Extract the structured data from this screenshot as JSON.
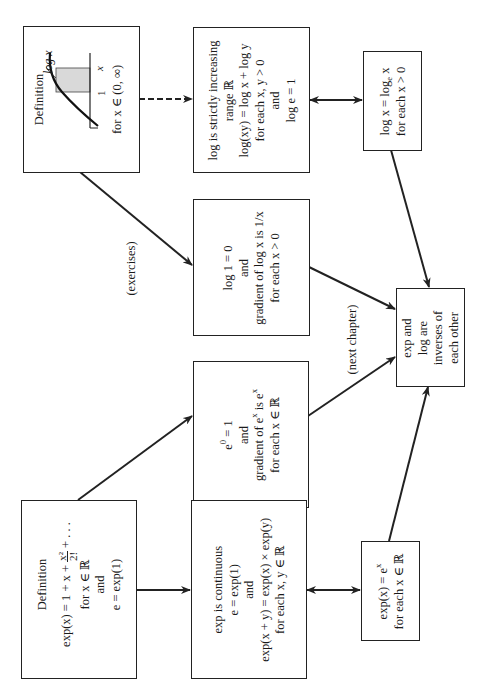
{
  "diagram": {
    "orientation": "rotated-90-ccw",
    "boxes": {
      "log_definition": {
        "title": "Definition",
        "graph_label": "log x",
        "axis_tick_1": "1",
        "axis_tick_x": "x",
        "domain": "for x ∈ (0, ∞)"
      },
      "log_properties": {
        "lines": [
          "log is strictly increasing",
          "range ℝ",
          "log(xy) = log x + log y",
          "for each x, y > 0",
          "and",
          "log e = 1"
        ]
      },
      "log_base_e": {
        "lines": [
          "log x = log",
          "for each x > 0"
        ],
        "subscript": "e",
        "after_subscript": " x"
      },
      "log_one_gradient": {
        "lines": [
          "log 1 = 0",
          "and",
          "gradient of log x is 1/x",
          "for each x > 0"
        ]
      },
      "exp_zero_gradient": {
        "line1_base": "e",
        "line1_sup": "0",
        "line1_rest": " = 1",
        "line2": "and",
        "line3_pre": "gradient of e",
        "line3_sup": "x",
        "line3_post": " is e",
        "line3_sup2": "x",
        "line4": "for each x ∈ ℝ"
      },
      "exp_definition": {
        "title": "Definition",
        "formula_pre": "exp(x) = 1 + x + ",
        "frac_num": "x²",
        "frac_den": "2!",
        "formula_post": " + . . .",
        "line3": "for x ∈ ℝ",
        "line4": "and",
        "line5": "e = exp(1)"
      },
      "exp_continuous": {
        "lines": [
          "exp is continuous",
          "e = exp(1)",
          "and",
          "exp(x + y) = exp(x) × exp(y)",
          "for each x, y ∈ ℝ"
        ]
      },
      "exp_power": {
        "line1_pre": "exp(x) = e",
        "line1_sup": "x",
        "line2": "for each x ∈ ℝ"
      },
      "inverses": {
        "lines": [
          "exp and",
          "log are",
          "inverses of",
          "each other"
        ]
      }
    },
    "edge_labels": {
      "exercises": "(exercises)",
      "next_chapter": "(next chapter)"
    },
    "edges": [
      {
        "from": "log_definition",
        "to": "log_properties",
        "style": "dashed",
        "arrow": "end"
      },
      {
        "from": "log_properties",
        "to": "log_base_e",
        "style": "solid",
        "arrow": "both"
      },
      {
        "from": "log_definition",
        "to": "log_one_gradient",
        "style": "solid",
        "arrow": "end",
        "label": "(exercises)"
      },
      {
        "from": "log_one_gradient",
        "to": "inverses",
        "style": "solid",
        "arrow": "end"
      },
      {
        "from": "exp_zero_gradient",
        "to": "inverses",
        "style": "solid",
        "arrow": "end",
        "label": "(next chapter)"
      },
      {
        "from": "log_base_e",
        "to": "inverses",
        "style": "solid",
        "arrow": "end"
      },
      {
        "from": "exp_power",
        "to": "inverses",
        "style": "solid",
        "arrow": "end"
      },
      {
        "from": "exp_definition",
        "to": "exp_zero_gradient",
        "style": "solid",
        "arrow": "end"
      },
      {
        "from": "exp_definition",
        "to": "exp_continuous",
        "style": "solid",
        "arrow": "end"
      },
      {
        "from": "exp_continuous",
        "to": "exp_power",
        "style": "solid",
        "arrow": "both"
      }
    ]
  }
}
